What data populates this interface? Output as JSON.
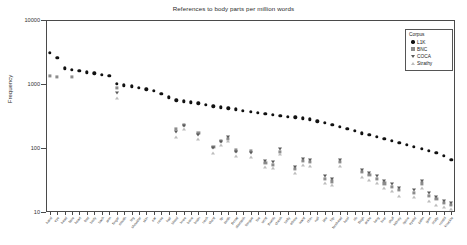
{
  "chart_data": {
    "type": "scatter",
    "title": "References to body parts per million words",
    "xlabel": "",
    "ylabel": "Frequency",
    "yscale": "log",
    "ylim": [
      10,
      10000
    ],
    "yticks": [
      10000,
      1000,
      100,
      10
    ],
    "ytick_labels": [
      "10000",
      "1000",
      "100",
      "10"
    ],
    "grid": false,
    "legend": {
      "title": "Corpus",
      "position": "top-right",
      "entries": [
        {
          "name": "L1K",
          "marker": "circle",
          "color": "#111111"
        },
        {
          "name": "BNC",
          "marker": "square",
          "color": "#8c8c8c"
        },
        {
          "name": "COCA",
          "marker": "triangle-down",
          "color": "#5a5a5a"
        },
        {
          "name": "Strathy",
          "marker": "triangle-up",
          "color": "#bdbdbd"
        }
      ]
    },
    "categories": [
      "hand",
      "eye",
      "head",
      "face",
      "heart",
      "foot",
      "body",
      "back",
      "arm",
      "finger",
      "mouth",
      "leg",
      "shoulder",
      "skin",
      "ear",
      "nose",
      "hair",
      "blood",
      "knee",
      "bone",
      "brain",
      "neck",
      "chest",
      "lip",
      "tooth",
      "throat",
      "stomach",
      "tongue",
      "toe",
      "wrist",
      "thumb",
      "cheek",
      "belly",
      "elbow",
      "waist",
      "chin",
      "nail",
      "jaw",
      "hip",
      "forehead",
      "heel",
      "rib",
      "thigh",
      "ankle",
      "lung",
      "liver",
      "skull",
      "kidney",
      "spine",
      "eyelid",
      "palm",
      "gum",
      "scalp",
      "nostril",
      "knuckle"
    ],
    "series": [
      {
        "name": "L1K",
        "marker": "circle",
        "values": [
          3100,
          2550,
          1750,
          1680,
          1600,
          1520,
          1470,
          1400,
          1330,
          1000,
          960,
          920,
          870,
          830,
          790,
          700,
          620,
          560,
          540,
          520,
          500,
          470,
          450,
          430,
          415,
          400,
          385,
          370,
          355,
          345,
          330,
          320,
          310,
          300,
          290,
          280,
          260,
          245,
          230,
          215,
          200,
          185,
          170,
          160,
          150,
          140,
          130,
          120,
          112,
          104,
          97,
          90,
          84,
          76,
          66
        ]
      },
      {
        "name": "BNC",
        "marker": "square",
        "values": [
          1330,
          1300,
          null,
          1280,
          null,
          null,
          null,
          null,
          null,
          870,
          null,
          null,
          null,
          null,
          null,
          null,
          null,
          200,
          230,
          null,
          170,
          null,
          105,
          130,
          140,
          92,
          null,
          90,
          null,
          58,
          55,
          88,
          null,
          47,
          63,
          60,
          null,
          33,
          30,
          60,
          null,
          null,
          42,
          38,
          33,
          28,
          25,
          22,
          null,
          20,
          28,
          18,
          16,
          14,
          13
        ]
      },
      {
        "name": "COCA",
        "marker": "triangle-down",
        "values": [
          null,
          null,
          null,
          null,
          null,
          null,
          null,
          null,
          null,
          720,
          null,
          null,
          null,
          null,
          null,
          null,
          null,
          180,
          220,
          null,
          160,
          null,
          100,
          125,
          150,
          88,
          null,
          85,
          null,
          62,
          60,
          95,
          null,
          50,
          68,
          64,
          null,
          36,
          33,
          64,
          null,
          null,
          45,
          41,
          36,
          30,
          27,
          24,
          null,
          22,
          30,
          20,
          17,
          15,
          14
        ]
      },
      {
        "name": "Strathy",
        "marker": "triangle-up",
        "values": [
          null,
          null,
          null,
          null,
          null,
          null,
          null,
          null,
          null,
          600,
          null,
          null,
          null,
          null,
          null,
          null,
          null,
          150,
          195,
          null,
          140,
          null,
          85,
          110,
          128,
          75,
          null,
          72,
          null,
          50,
          48,
          80,
          null,
          40,
          55,
          52,
          null,
          28,
          26,
          52,
          null,
          null,
          35,
          32,
          28,
          24,
          21,
          18,
          null,
          17,
          24,
          15,
          13,
          12,
          11
        ]
      }
    ]
  }
}
